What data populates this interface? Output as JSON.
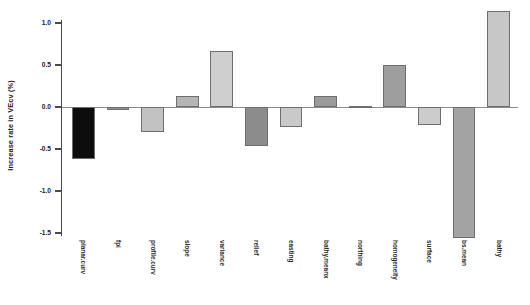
{
  "chart_data": {
    "type": "bar",
    "title": "",
    "subtitle": "",
    "xlabel": "",
    "ylabel": "Increase rate in VEcv (%)",
    "ylim": [
      -1.75,
      1.25
    ],
    "yticks": [
      "1.0",
      "0.5",
      "0.0",
      "-0.5",
      "-1.0",
      "-1.5"
    ],
    "ytick_values": [
      1.0,
      0.5,
      0.0,
      -0.5,
      -1.0,
      -1.5
    ],
    "grid": false,
    "legend": "none",
    "zero_reference_line": true,
    "categories": [
      "planar.curv",
      "fpi",
      "profile.curv",
      "slope",
      "variance",
      "relief",
      "easting",
      "bathy.meanx",
      "northing",
      "homogeneity",
      "surface",
      "bs.mean",
      "bathy"
    ],
    "values": [
      -0.62,
      -0.04,
      -0.3,
      0.13,
      0.67,
      -0.46,
      -0.24,
      0.13,
      0.01,
      0.5,
      -0.21,
      -1.56,
      1.14
    ],
    "bar_colors": [
      "#0d0d0d",
      "#8f8f8f",
      "#c2c2c2",
      "#b5b5b5",
      "#cfcfcf",
      "#8c8c8c",
      "#c9c9c9",
      "#9a9a9a",
      "#a8a8a8",
      "#9e9e9e",
      "#cccccc",
      "#a3a3a3",
      "#c7c7c7"
    ],
    "bar_edge_color": "#6e6e6e",
    "axis_color": "#4a4a4a",
    "text_color": "#1a1a1a"
  }
}
